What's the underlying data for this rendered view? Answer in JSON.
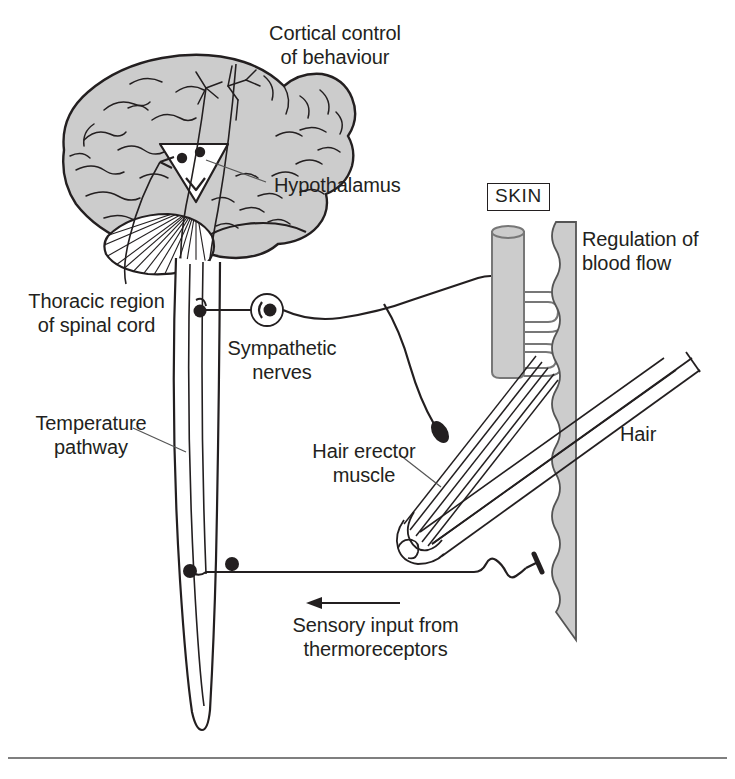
{
  "figure": {
    "width": 735,
    "height": 779,
    "background": "#ffffff",
    "ink_color": "#231f20",
    "fill_gray": "#cccccc",
    "line_color": "#3a3a3a"
  },
  "labels": {
    "cortical_control": "Cortical control\nof behaviour",
    "hypothalamus": "Hypothalamus",
    "thoracic_region": "Thoracic region\nof spinal cord",
    "sympathetic_nerves": "Sympathetic\nnerves",
    "temperature_pathway": "Temperature\npathway",
    "skin": "SKIN",
    "regulation_blood_flow": "Regulation of\nblood flow",
    "hair": "Hair",
    "hair_erector_muscle": "Hair erector\nmuscle",
    "sensory_input": "Sensory input from\nthermoreceptors"
  },
  "structures": {
    "brain": "cerebrum-gray-filled-with-gyri",
    "cerebellum": "hatched-fan",
    "hypothalamus_marker": "white-inverted-triangle-with-two-dots",
    "spinal_cord": "long-tapering-vertical-cord",
    "ganglion": "circle-with-central-dot",
    "synapse_dots": "filled-black-circles",
    "blood_vessel": "gray-tube-with-two-capillary-loops",
    "skin_layer": "gray-band-with-wavy-inner-edge",
    "hair_shaft": "diagonal-double-line-with-tip",
    "hair_follicle": "spiral-bulb",
    "erector_muscle": "striated-fiber-bundle",
    "nerve_ending": "black-oval-terminal",
    "thermoreceptor": "squiggle-with-flat-terminal",
    "sensory_arrow": "left-pointing-arrow"
  },
  "bottom_rule": "horizontal-divider-line"
}
